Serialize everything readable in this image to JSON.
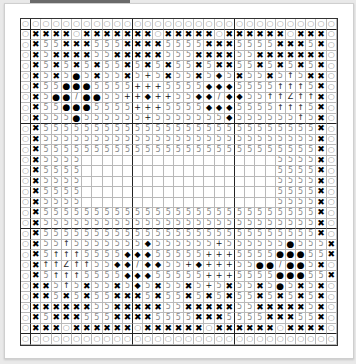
{
  "chart": {
    "type": "cross-stitch-pattern",
    "columns": 31,
    "rows_count": 31,
    "legend": {
      "o": {
        "glyph": "○",
        "name": "open-circle"
      },
      "x": {
        "glyph": "✖",
        "name": "heavy-x"
      },
      "s": {
        "glyph": "5",
        "name": "five"
      },
      "c": {
        "glyph": "●",
        "name": "filled-circle"
      },
      "d": {
        "glyph": "◆",
        "name": "filled-diamond"
      },
      "p": {
        "glyph": "+",
        "name": "plus"
      },
      "u": {
        "glyph": "↑",
        "name": "up-arrow"
      },
      "z": {
        "glyph": "Z",
        "name": "letter-z"
      },
      "l": {
        "glyph": "/",
        "name": "slash"
      },
      "_": {
        "glyph": "",
        "name": "blank"
      }
    },
    "rows": [
      "ooooooooooooooooooooooooooooooo",
      "oxxxxoxxxxxxxoxxxxxoxxxxxxoxxxo",
      "oxssxxxsssxxxxssssxxxssssxxxsxo",
      "oxsxxxxssxxxxxsssxxxxssxxxxxxxo",
      "oxsxsxsxssxsxsxssxsxxssxsxsxsxo",
      "oxsxscsxssxspsxssxsdsxssxsusxxo",
      "oxssccсsssspppssssdddssssuuusxo",
      "oxscclccssppdppssddlddssuuzuuxo",
      "oxssccсsssspppssssdddssssuuusxo",
      "oxsssсsssssspsssssssdssssssusxo",
      "oxsssssssssssssssssssssssssssxo",
      "oxsssssssssssssssssssssssssssxo",
      "oxsssssssssssssssssssssssssssxo",
      "oxssss___________________ssssxo",
      "oxssss___________________ssssxo",
      "oxssss___________________ssssxo",
      "oxssss___________________ssssxo",
      "oxssss___________________ssssxo",
      "oxsssssssssssssssssssssssssssxo",
      "oxsssssssssssssssssssssssssssxo",
      "oxsssssssssssssssssssssssssssxo",
      "oxssusssssssdsssssspsssssscsssxo",
      "oxsuuussssdddssssspppssssccсssxo",
      "oxuuzuussddlddsspdpppsscclccsxo",
      "oxsuuussssdddssssspppssssccсssxo",
      "oxxsusxssxsdsxssxspsxssxscsxsxo",
      "oxxsxsxssxxxsxssxsxsxssxsxsxsxo",
      "oxxxxxxssxxxxxssxxxxxssxxxxxsxo",
      "oxsxxxsssxxxxssssxxxssssxxxssxo",
      "oxxxoxxxxxxoxxxxxxoxxxxxxoxxxxo",
      "ooooooooooooooooooooooooooooooo"
    ]
  }
}
